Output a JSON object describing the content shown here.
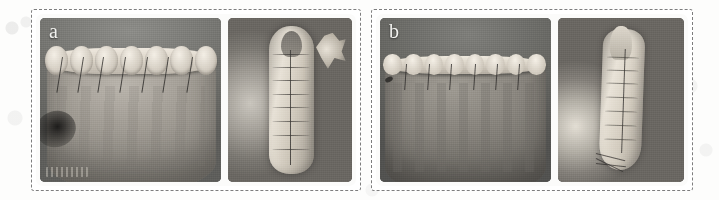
{
  "figure": {
    "type": "scientific-figure",
    "background_color": "#fdfdfc",
    "frame_style": "dashed",
    "frame_color": "#7d7d7d",
    "panels": [
      {
        "label": "a",
        "label_color": "#f2f2ef",
        "photos": [
          {
            "name": "frontal-view",
            "caption_text": "",
            "orientation": "wide"
          },
          {
            "name": "top-view",
            "caption_text": "",
            "orientation": "narrow"
          }
        ]
      },
      {
        "label": "b",
        "label_color": "#f2f2ef",
        "photos": [
          {
            "name": "frontal-view",
            "caption_text": "",
            "orientation": "wide"
          },
          {
            "name": "side-view",
            "caption_text": "",
            "orientation": "narrow"
          }
        ]
      }
    ]
  }
}
